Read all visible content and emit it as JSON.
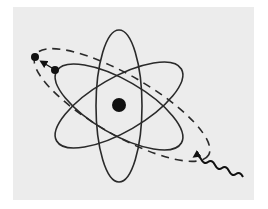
{
  "figure": {
    "title": "",
    "colors": {
      "background": "#ffffff",
      "panel": "#ececec",
      "stroke": "#2a2a2a",
      "fill": "#111111"
    },
    "elements": {
      "nucleus": {
        "cx": 119,
        "cy": 105,
        "r": 7
      },
      "orbits": [
        {
          "name": "vertical-orbit",
          "cx": 119,
          "cy": 106,
          "rx": 23,
          "ry": 76,
          "rotate": 0,
          "style": "solid"
        },
        {
          "name": "tilted-orbit-down",
          "cx": 119,
          "cy": 107,
          "rx": 72,
          "ry": 27,
          "rotate": 30,
          "style": "solid"
        },
        {
          "name": "tilted-orbit-up",
          "cx": 119,
          "cy": 105,
          "rx": 72,
          "ry": 27,
          "rotate": -30,
          "style": "solid"
        },
        {
          "name": "excited-orbit",
          "cx": 122,
          "cy": 105,
          "rx": 100,
          "ry": 30,
          "rotate": 30,
          "style": "dashed"
        }
      ],
      "electrons": [
        {
          "name": "excited-electron",
          "cx": 35,
          "cy": 57,
          "r": 4
        },
        {
          "name": "ground-electron",
          "cx": 55,
          "cy": 70,
          "r": 4
        }
      ],
      "transition_arrow": {
        "from": [
          52,
          68
        ],
        "to": [
          41,
          61
        ]
      },
      "photon": {
        "start": [
          243,
          177
        ],
        "end": [
          193,
          149
        ]
      }
    }
  }
}
